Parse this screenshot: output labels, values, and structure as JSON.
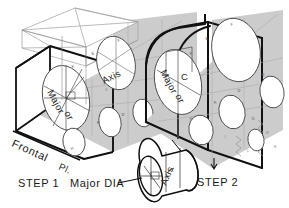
{
  "drawing": {
    "title": "Isometric construction of an ellipse on inclined planes",
    "background_color": "#ffffff",
    "ink_color": "#111111",
    "face_gray": "#c9c9c9",
    "face_gray_dark": "#bcbcbc",
    "face_white": "#ffffff",
    "construction_color": "#9a9a9a"
  },
  "labels": {
    "step1": "STEP 1",
    "step2": "STEP 2",
    "frontal_plane": "Frontal",
    "frontal_plane_abbrev": "Pl.",
    "major_dia_callout": "Major  DIA",
    "axis_left": "Axis",
    "axis_cylinder": "Axis",
    "major_left": "Major",
    "major_left_cont": "or",
    "major_right": "Major",
    "major_right_cont": "or",
    "c_marker": "C"
  },
  "template_marks": {
    "left_block": [
      "E",
      "K",
      "B",
      "D",
      "A",
      "F",
      "H",
      "G",
      "J",
      "M"
    ],
    "right_block": [
      "E",
      "K",
      "B",
      "D",
      "A",
      "F",
      "H",
      "G",
      "J",
      "M",
      "L",
      "N"
    ]
  },
  "step1_block": {
    "name": "Left isometric block with frontal plane and construction box",
    "has_construction_box": true,
    "ellipse_count": 5
  },
  "step2_block": {
    "name": "Right isometric block with rounded top and ellipse template overlay",
    "has_rounded_top": true,
    "ellipse_count": 6
  },
  "cylinder_detail": {
    "name": "Cylinder detail showing major diameter and axis",
    "axis_label": "Axis"
  }
}
